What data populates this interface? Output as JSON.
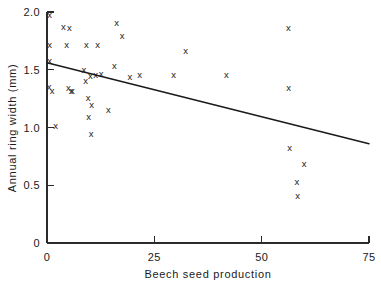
{
  "chart_data": {
    "type": "scatter",
    "title": "",
    "xlabel": "Beech seed production",
    "ylabel": "Annual ring width (mm)",
    "xlim": [
      0,
      75
    ],
    "ylim": [
      0,
      2.0
    ],
    "xticks": [
      0,
      25,
      50,
      75
    ],
    "xtick_labels": [
      "0",
      "25",
      "50",
      "75"
    ],
    "yticks": [
      0,
      0.5,
      1.0,
      1.5,
      2.0
    ],
    "ytick_labels": [
      "0",
      "0.5",
      "1.0",
      "1.5",
      "2.0"
    ],
    "grid": false,
    "legend": "none",
    "marker": "x",
    "marker_color": "#1a1a1a",
    "points": [
      {
        "x": 0.6,
        "y": 1.97
      },
      {
        "x": 0.6,
        "y": 1.71
      },
      {
        "x": 0.6,
        "y": 1.57
      },
      {
        "x": 0.5,
        "y": 1.35
      },
      {
        "x": 1.2,
        "y": 1.31
      },
      {
        "x": 2.0,
        "y": 1.01
      },
      {
        "x": 3.8,
        "y": 1.87
      },
      {
        "x": 5.2,
        "y": 1.86
      },
      {
        "x": 4.6,
        "y": 1.71
      },
      {
        "x": 5.0,
        "y": 1.34
      },
      {
        "x": 5.6,
        "y": 1.31
      },
      {
        "x": 5.9,
        "y": 1.31
      },
      {
        "x": 8.6,
        "y": 1.49
      },
      {
        "x": 9.0,
        "y": 1.4
      },
      {
        "x": 9.2,
        "y": 1.71
      },
      {
        "x": 9.6,
        "y": 1.25
      },
      {
        "x": 9.7,
        "y": 1.09
      },
      {
        "x": 10.1,
        "y": 1.44
      },
      {
        "x": 10.4,
        "y": 1.19
      },
      {
        "x": 10.3,
        "y": 0.94
      },
      {
        "x": 11.3,
        "y": 1.45
      },
      {
        "x": 11.8,
        "y": 1.71
      },
      {
        "x": 12.6,
        "y": 1.46
      },
      {
        "x": 14.3,
        "y": 1.15
      },
      {
        "x": 15.7,
        "y": 1.53
      },
      {
        "x": 16.2,
        "y": 1.9
      },
      {
        "x": 17.5,
        "y": 1.79
      },
      {
        "x": 19.3,
        "y": 1.43
      },
      {
        "x": 21.6,
        "y": 1.45
      },
      {
        "x": 29.5,
        "y": 1.45
      },
      {
        "x": 32.3,
        "y": 1.66
      },
      {
        "x": 41.8,
        "y": 1.45
      },
      {
        "x": 56.2,
        "y": 1.86
      },
      {
        "x": 56.3,
        "y": 1.34
      },
      {
        "x": 56.5,
        "y": 0.82
      },
      {
        "x": 59.9,
        "y": 0.68
      },
      {
        "x": 58.2,
        "y": 0.52
      },
      {
        "x": 58.4,
        "y": 0.4
      }
    ],
    "fit_line": {
      "label": "regression line",
      "x_start": 0,
      "y_start": 1.56,
      "x_end": 75,
      "y_end": 0.86
    }
  }
}
